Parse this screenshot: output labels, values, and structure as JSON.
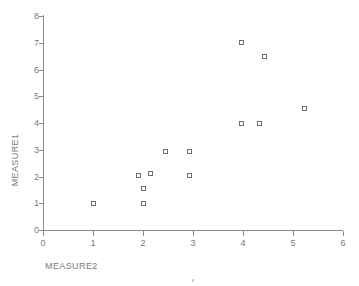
{
  "chart_data": {
    "type": "scatter",
    "title": "",
    "xlabel": "MEASURE2",
    "ylabel": "MEASURE1",
    "xlim": [
      0,
      6
    ],
    "ylim": [
      0,
      8
    ],
    "xticks": [
      "0",
      "1",
      "2",
      "3",
      "4",
      "5",
      "6"
    ],
    "yticks": [
      "0",
      "1",
      "2",
      "3",
      "4",
      "5",
      "6",
      "7",
      "8"
    ],
    "grid": false,
    "legend": null,
    "marker": "open-square",
    "marker_color": "#6e6e6e",
    "axis_color": "#8a8a8a",
    "points": [
      {
        "x": 1.0,
        "y": 1.0
      },
      {
        "x": 2.0,
        "y": 1.0
      },
      {
        "x": 2.0,
        "y": 1.55
      },
      {
        "x": 1.9,
        "y": 2.05
      },
      {
        "x": 2.15,
        "y": 2.1
      },
      {
        "x": 2.45,
        "y": 2.95
      },
      {
        "x": 2.92,
        "y": 2.05
      },
      {
        "x": 2.92,
        "y": 2.95
      },
      {
        "x": 3.96,
        "y": 4.0
      },
      {
        "x": 4.33,
        "y": 4.0
      },
      {
        "x": 3.96,
        "y": 7.0
      },
      {
        "x": 4.43,
        "y": 6.5
      },
      {
        "x": 5.22,
        "y": 4.55
      }
    ]
  },
  "geometry": {
    "origin_x_px": 43,
    "origin_y_px": 230,
    "px_per_x_unit": 50.0,
    "px_per_y_unit": 26.75
  }
}
